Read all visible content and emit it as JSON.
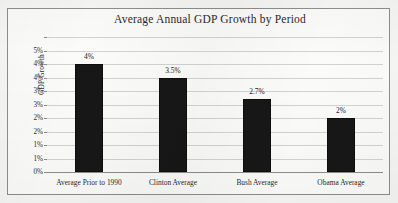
{
  "chart_data": {
    "type": "bar",
    "title": "Average Annual GDP Growth by Period",
    "xlabel": "",
    "ylabel": "GDP Growth",
    "categories": [
      "Average Prior to 1990",
      "Clinton Average",
      "Bush Average",
      "Obama Average"
    ],
    "values": [
      4.0,
      3.5,
      2.7,
      2.0
    ],
    "value_labels": [
      "4%",
      "3.5%",
      "2.7%",
      "2%"
    ],
    "ylim": [
      0,
      5
    ],
    "ytick_values": [
      0,
      0.5,
      1,
      1.5,
      2,
      2.5,
      3,
      3.5,
      4,
      4.5,
      5
    ],
    "ytick_labels": [
      "0%",
      "1%",
      "1%",
      "2%",
      "2%",
      "3%",
      "3%",
      "4%",
      "4%",
      "5%"
    ],
    "grid": true,
    "legend": false,
    "legend_position": "none",
    "bar_color": "#171717",
    "gridline_color": "#d2d2d2",
    "axis_color": "#8d8d8d",
    "plot_background": "#fbfbf9"
  }
}
